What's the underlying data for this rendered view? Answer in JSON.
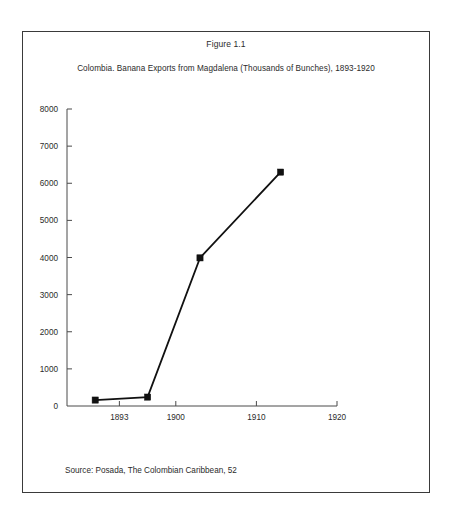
{
  "figure": {
    "title": "Figure 1.1",
    "subtitle": "Colombia. Banana Exports from Magdalena (Thousands of Bunches), 1893-1920",
    "source": "Source: Posada, The Colombian Caribbean, 52",
    "border_color": "#3a3a3a",
    "background": "#ffffff"
  },
  "chart_data": {
    "type": "line",
    "title": "Colombia. Banana Exports from Magdalena (Thousands of Bunches), 1893-1920",
    "xlabel": "",
    "ylabel": "",
    "x": [
      1890,
      1896.5,
      1903,
      1913
    ],
    "values": [
      160,
      240,
      3990,
      6300
    ],
    "series": [
      {
        "name": "Banana Exports from Magdalena",
        "x": [
          1890,
          1896.5,
          1903,
          1913
        ],
        "values": [
          160,
          240,
          3990,
          6300
        ]
      }
    ],
    "xlim": [
      1886.5,
      1920
    ],
    "ylim": [
      0,
      8000
    ],
    "xticks": [
      1893,
      1900,
      1910,
      1920
    ],
    "xtick_labels": [
      "1893",
      "1900",
      "1910",
      "1920"
    ],
    "yticks": [
      0,
      1000,
      2000,
      3000,
      4000,
      5000,
      6000,
      7000,
      8000
    ],
    "ytick_labels": [
      "0",
      "1000",
      "2000",
      "3000",
      "4000",
      "5000",
      "6000",
      "7000",
      "8000"
    ],
    "grid": false,
    "legend": null,
    "marker": "square",
    "line_color": "#111111",
    "marker_color": "#111111"
  }
}
